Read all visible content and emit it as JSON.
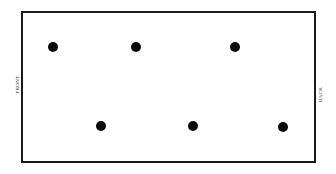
{
  "diagram": {
    "labels": {
      "front": "FRONT",
      "back": "BACK"
    },
    "colors": {
      "background": "#ffffff",
      "border": "#1a1a1a",
      "dot": "#0a0a0a",
      "label_text": "#2b2b2b"
    },
    "rectangle": {
      "x": 21,
      "y": 11,
      "width": 295,
      "height": 152,
      "border_width": 2
    },
    "dot_diameter": 10,
    "points": [
      {
        "id": "point-top-1",
        "row": "top",
        "index": 1,
        "x": 53,
        "y": 47
      },
      {
        "id": "point-top-2",
        "row": "top",
        "index": 2,
        "x": 136,
        "y": 47
      },
      {
        "id": "point-top-3",
        "row": "top",
        "index": 3,
        "x": 235,
        "y": 47
      },
      {
        "id": "point-bottom-1",
        "row": "bottom",
        "index": 1,
        "x": 101,
        "y": 126
      },
      {
        "id": "point-bottom-2",
        "row": "bottom",
        "index": 2,
        "x": 193,
        "y": 126
      },
      {
        "id": "point-bottom-3",
        "row": "bottom",
        "index": 3,
        "x": 283,
        "y": 127
      }
    ]
  }
}
